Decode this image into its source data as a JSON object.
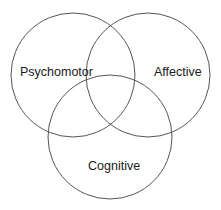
{
  "diagram": {
    "type": "venn",
    "sets": [
      {
        "id": "psychomotor",
        "label": "Psychomotor",
        "cx": 73,
        "cy": 75,
        "r": 62,
        "label_x": 20,
        "label_y": 76
      },
      {
        "id": "affective",
        "label": "Affective",
        "cx": 148,
        "cy": 75,
        "r": 62,
        "label_x": 154,
        "label_y": 76
      },
      {
        "id": "cognitive",
        "label": "Cognitive",
        "cx": 110,
        "cy": 137,
        "r": 62,
        "label_x": 88,
        "label_y": 170
      }
    ],
    "stroke_color": "#555555",
    "text_color": "#1a1a1a",
    "background": "#ffffff"
  }
}
